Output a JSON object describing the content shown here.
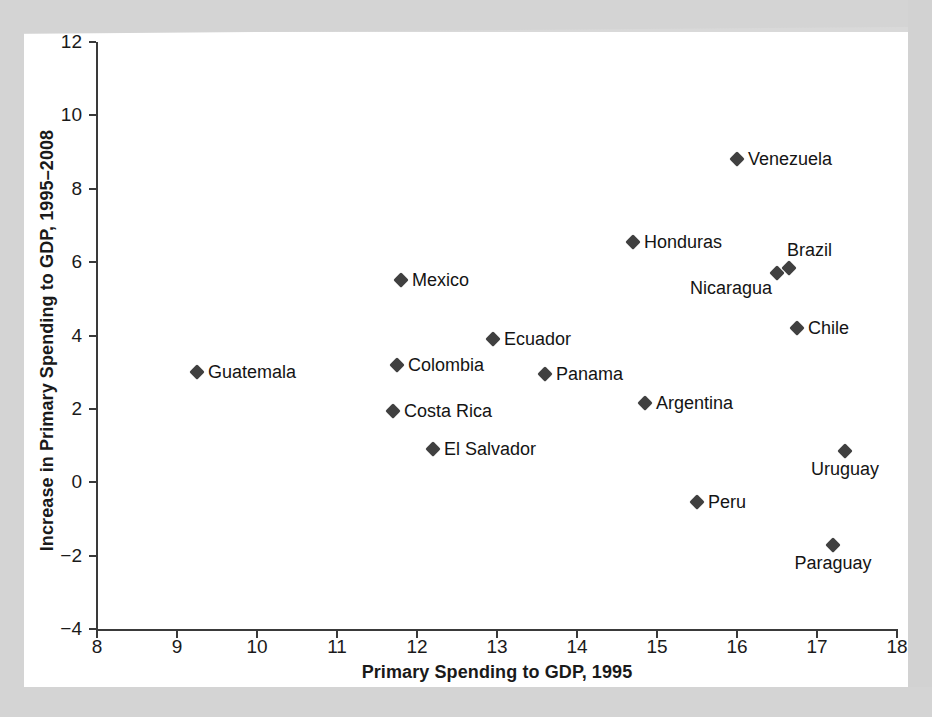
{
  "figure": {
    "background_color": "#d9d9d9",
    "plot_background_color": "#ffffff",
    "marker_color": "#404040",
    "axis_color": "#3a3a3a",
    "text_color": "#141414"
  },
  "chart_data": {
    "type": "scatter",
    "title": "",
    "xlabel": "Primary Spending to GDP, 1995",
    "ylabel": "Increase in Primary Spending to GDP, 1995–2008",
    "xlim": [
      8,
      18
    ],
    "ylim": [
      -4,
      12
    ],
    "xticks": [
      "8",
      "9",
      "10",
      "11",
      "12",
      "13",
      "14",
      "15",
      "16",
      "17",
      "18"
    ],
    "yticks": [
      "-4",
      "-2",
      "0",
      "2",
      "4",
      "6",
      "8",
      "10",
      "12"
    ],
    "grid": false,
    "legend": "none",
    "points": [
      {
        "label": "Guatemala",
        "x": 9.25,
        "y": 3.0,
        "label_pos": "right"
      },
      {
        "label": "Mexico",
        "x": 11.8,
        "y": 5.5,
        "label_pos": "right"
      },
      {
        "label": "Colombia",
        "x": 11.75,
        "y": 3.2,
        "label_pos": "right"
      },
      {
        "label": "Costa Rica",
        "x": 11.7,
        "y": 1.95,
        "label_pos": "right"
      },
      {
        "label": "El Salvador",
        "x": 12.2,
        "y": 0.9,
        "label_pos": "right"
      },
      {
        "label": "Ecuador",
        "x": 12.95,
        "y": 3.9,
        "label_pos": "right"
      },
      {
        "label": "Panama",
        "x": 13.6,
        "y": 2.95,
        "label_pos": "right"
      },
      {
        "label": "Honduras",
        "x": 14.7,
        "y": 6.55,
        "label_pos": "right"
      },
      {
        "label": "Argentina",
        "x": 14.85,
        "y": 2.15,
        "label_pos": "right"
      },
      {
        "label": "Peru",
        "x": 15.5,
        "y": -0.55,
        "label_pos": "right"
      },
      {
        "label": "Venezuela",
        "x": 16.0,
        "y": 8.8,
        "label_pos": "right"
      },
      {
        "label": "Nicaragua",
        "x": 16.5,
        "y": 5.7,
        "label_pos": "below-left"
      },
      {
        "label": "Brazil",
        "x": 16.65,
        "y": 5.85,
        "label_pos": "above-right"
      },
      {
        "label": "Chile",
        "x": 16.75,
        "y": 4.2,
        "label_pos": "right"
      },
      {
        "label": "Uruguay",
        "x": 17.35,
        "y": 0.85,
        "label_pos": "below"
      },
      {
        "label": "Paraguay",
        "x": 17.2,
        "y": -1.7,
        "label_pos": "below"
      }
    ]
  }
}
